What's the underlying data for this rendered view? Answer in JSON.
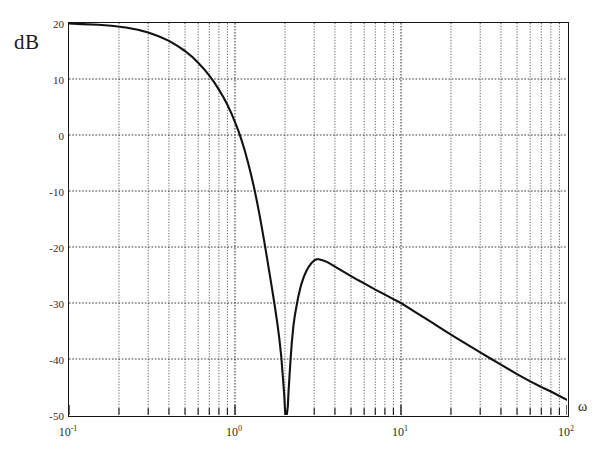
{
  "figure": {
    "y_axis_unit_label": "dB",
    "x_axis_symbol": "ω"
  },
  "chart_data": {
    "type": "line",
    "title": "",
    "subtitle": "",
    "xlabel": "ω",
    "ylabel": "dB",
    "xscale": "log",
    "yscale": "linear",
    "xlim": [
      0.1,
      100
    ],
    "ylim": [
      -50,
      20
    ],
    "grid": true,
    "grid_style": "dotted",
    "minor_grid": true,
    "legend": null,
    "legend_position": "none",
    "xticks": [
      0.1,
      1,
      10,
      100
    ],
    "xtick_labels": [
      "10-1",
      "100",
      "101",
      "102"
    ],
    "xtick_label_mantissa": [
      "10",
      "10",
      "10",
      "10"
    ],
    "xtick_label_exponent": [
      "-1",
      "0",
      "1",
      "2"
    ],
    "yticks": [
      20,
      10,
      0,
      -10,
      -20,
      -30,
      -40,
      -50
    ],
    "ytick_labels": [
      "20",
      "10",
      "0",
      "-10",
      "-20",
      "-30",
      "-40",
      "-50"
    ],
    "annotations": [],
    "notch_frequency": 2.05,
    "notch_depth_db": -50,
    "post_notch_peak_frequency": 3.1,
    "post_notch_peak_db": -22,
    "high_frequency_slope_db_per_decade": -20,
    "series": [
      {
        "name": "magnitude",
        "color": "#121212",
        "x": [
          0.1,
          0.12,
          0.15,
          0.18,
          0.22,
          0.26,
          0.3,
          0.35,
          0.4,
          0.45,
          0.5,
          0.55,
          0.6,
          0.65,
          0.7,
          0.75,
          0.8,
          0.85,
          0.9,
          0.95,
          1.0,
          1.05,
          1.1,
          1.15,
          1.2,
          1.25,
          1.3,
          1.35,
          1.4,
          1.45,
          1.5,
          1.55,
          1.6,
          1.65,
          1.7,
          1.75,
          1.8,
          1.85,
          1.9,
          1.95,
          1.98,
          2.0,
          2.02,
          2.05,
          2.08,
          2.1,
          2.13,
          2.16,
          2.2,
          2.25,
          2.3,
          2.4,
          2.5,
          2.6,
          2.7,
          2.8,
          2.9,
          3.0,
          3.1,
          3.2,
          3.4,
          3.6,
          3.8,
          4.0,
          4.5,
          5.0,
          5.5,
          6.0,
          7.0,
          8.0,
          9.0,
          10.0,
          12.0,
          15.0,
          18.0,
          22.0,
          26.0,
          30.0,
          35.0,
          40.0,
          50.0,
          60.0,
          70.0,
          80.0,
          90.0,
          100.0
        ],
        "y": [
          19.9,
          19.8,
          19.7,
          19.5,
          19.2,
          18.8,
          18.3,
          17.6,
          16.8,
          15.9,
          15.0,
          14.0,
          12.9,
          11.8,
          10.6,
          9.4,
          8.1,
          6.8,
          5.4,
          3.9,
          2.3,
          0.7,
          -1.1,
          -3.0,
          -5.0,
          -7.1,
          -9.3,
          -11.6,
          -14.0,
          -16.5,
          -19.0,
          -21.5,
          -24.0,
          -26.4,
          -28.8,
          -31.2,
          -33.7,
          -36.4,
          -39.6,
          -43.8,
          -46.5,
          -49.0,
          -50.0,
          -50.0,
          -48.5,
          -46.0,
          -43.0,
          -40.2,
          -37.0,
          -34.0,
          -32.0,
          -29.0,
          -26.8,
          -25.3,
          -24.2,
          -23.4,
          -22.8,
          -22.4,
          -22.2,
          -22.2,
          -22.4,
          -22.7,
          -23.1,
          -23.5,
          -24.4,
          -25.2,
          -25.9,
          -26.5,
          -27.6,
          -28.5,
          -29.3,
          -30.0,
          -31.5,
          -33.3,
          -34.8,
          -36.4,
          -37.7,
          -38.8,
          -40.0,
          -41.0,
          -42.7,
          -44.0,
          -45.0,
          -45.8,
          -46.6,
          -47.3
        ]
      }
    ]
  }
}
